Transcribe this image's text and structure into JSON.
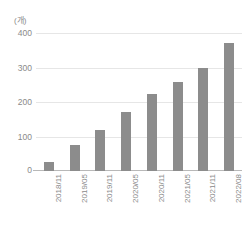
{
  "chart_data": {
    "type": "bar",
    "title": "",
    "subtitle": "",
    "xlabel": "",
    "ylabel": "",
    "unit_label": "(개)",
    "categories": [
      "2018/11",
      "2019/05",
      "2019/11",
      "2020/05",
      "2020/11",
      "2021/05",
      "2021/11",
      "2022/08"
    ],
    "values": [
      25,
      75,
      120,
      172,
      222,
      258,
      300,
      372
    ],
    "ylim": [
      0,
      400
    ],
    "yticks": [
      0,
      100,
      200,
      300,
      400
    ],
    "ytick_labels": [
      "0",
      "100",
      "200",
      "300",
      "400"
    ],
    "grid": true,
    "grid_axis": "y",
    "legend": false,
    "legend_position": "none",
    "bar_color": "#8c8c8c",
    "grid_color": "#e6e6e6",
    "axis_color": "#b8b8b8",
    "text_color": "#8a8a8a"
  }
}
